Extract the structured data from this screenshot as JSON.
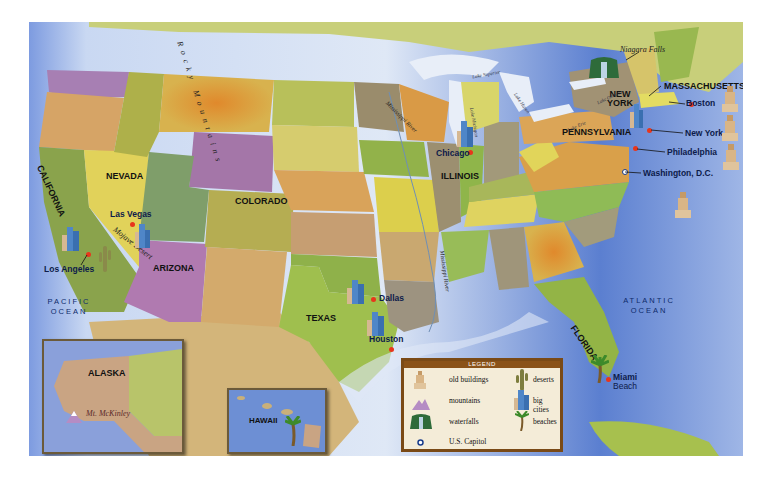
{
  "map": {
    "title": "United States Map",
    "states": {
      "california": "CALIFORNIA",
      "nevada": "NEVADA",
      "arizona": "ARIZONA",
      "colorado": "COLORADO",
      "texas": "TEXAS",
      "illinois": "ILLINOIS",
      "new_york": "NEW\nYORK",
      "pennsylvania": "PENNSYLVANIA",
      "massachusetts": "MASSACHUSETTS",
      "florida": "FLORIDA",
      "alaska": "ALASKA",
      "hawaii": "HAWAII"
    },
    "cities": {
      "los_angeles": "Los Angeles",
      "las_vegas": "Las Vegas",
      "dallas": "Dallas",
      "houston": "Houston",
      "chicago": "Chicago",
      "boston": "Boston",
      "new_york": "New York",
      "philadelphia": "Philadelphia",
      "washington": "Washington, D.C.",
      "miami_beach_1": "Miami",
      "miami_beach_2": "Beach"
    },
    "oceans": {
      "pacific_1": "PACIFIC",
      "pacific_2": "OCEAN",
      "atlantic_1": "ATLANTIC",
      "atlantic_2": "OCEAN"
    },
    "features": {
      "rocky_mountains": "Rocky Mountains",
      "mojave_desert": "Mojave Desert",
      "niagara_falls": "Niagara Falls",
      "mt_mckinley": "Mt. McKinley",
      "mississippi_river": "Mississippi River",
      "lake_superior": "Lake Superior",
      "lake_michigan": "Lake Michigan",
      "lake_huron": "Lake Huron",
      "lake_ontario": "Lake Ontario",
      "lake_erie": "Lake Erie"
    }
  },
  "legend": {
    "title": "LEGEND",
    "items": [
      {
        "icon": "old-buildings-icon",
        "label": "old buildings"
      },
      {
        "icon": "deserts-icon",
        "label": "deserts"
      },
      {
        "icon": "mountains-icon",
        "label": "mountains"
      },
      {
        "icon": "big-cities-icon",
        "label": "big cities"
      },
      {
        "icon": "waterfalls-icon",
        "label": "waterfalls"
      },
      {
        "icon": "beaches-icon",
        "label": "beaches"
      },
      {
        "icon": "us-capitol-icon",
        "label": "U.S. Capitol"
      }
    ]
  },
  "colors": {
    "ocean": "#6f8fd0",
    "city_dot": "#e8361c",
    "legend_header": "#8a5218",
    "legend_bg": "#f4ecd8"
  }
}
